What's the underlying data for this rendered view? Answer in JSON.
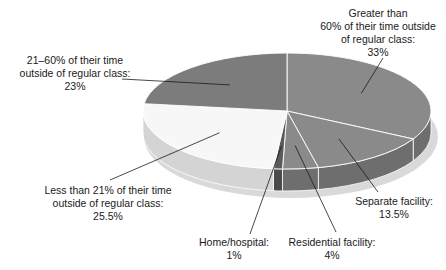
{
  "chart_data": {
    "type": "pie",
    "style": "3d",
    "title": "",
    "start_angle_deg": 0,
    "direction": "clockwise",
    "note": "Wedge angles are computed from the labelled percentages. In the source image the drawn wedges differ from these labels by a few points (e.g. the 'Less than 21%' wedge measures closer to ~23%, the '21-60%' wedge closer to ~25%).",
    "slices": [
      {
        "id": "gt60",
        "label": "Greater than 60% of their time outside of regular class",
        "value": 33,
        "display": "33%",
        "color": "#8a8a8a",
        "side": "#6e6e6e"
      },
      {
        "id": "separate",
        "label": "Separate facility",
        "value": 13.5,
        "display": "13.5%",
        "color": "#8a8a8a",
        "side": "#6e6e6e"
      },
      {
        "id": "residential",
        "label": "Residential facility",
        "value": 4,
        "display": "4%",
        "color": "#8a8a8a",
        "side": "#6e6e6e"
      },
      {
        "id": "home",
        "label": "Home/hospital",
        "value": 1,
        "display": "1%",
        "color": "#5a5a5a",
        "side": "#4a4a4a"
      },
      {
        "id": "lt21",
        "label": "Less than 21% of their time outside of regular class",
        "value": 25.5,
        "display": "25.5%",
        "color": "#f7f7f7",
        "side": "#d4d4d4"
      },
      {
        "id": "r2160",
        "label": "21–60% of their time outside of regular class",
        "value": 23,
        "display": "23%",
        "color": "#7c7c7c",
        "side": "#666666"
      }
    ],
    "categories": [
      "Greater than 60% of their time outside of regular class",
      "Separate facility",
      "Residential facility",
      "Home/hospital",
      "Less than 21% of their time outside of regular class",
      "21–60% of their time outside of regular class"
    ],
    "values": [
      33,
      13.5,
      4,
      1,
      25.5,
      23
    ]
  },
  "labels": {
    "gt60": {
      "lines": [
        "Greater than",
        "60% of their time outside",
        "of regular class:",
        "33%"
      ]
    },
    "separate": {
      "lines": [
        "Separate facility:",
        "13.5%"
      ]
    },
    "residential": {
      "lines": [
        "Residential facility:",
        "4%"
      ]
    },
    "home": {
      "lines": [
        "Home/hospital:",
        "1%"
      ]
    },
    "lt21": {
      "lines": [
        "Less than 21% of their time",
        "outside of regular class:",
        "25.5%"
      ]
    },
    "r2160": {
      "lines": [
        "21–60% of their time",
        "outside of regular class:",
        "23%"
      ]
    }
  }
}
